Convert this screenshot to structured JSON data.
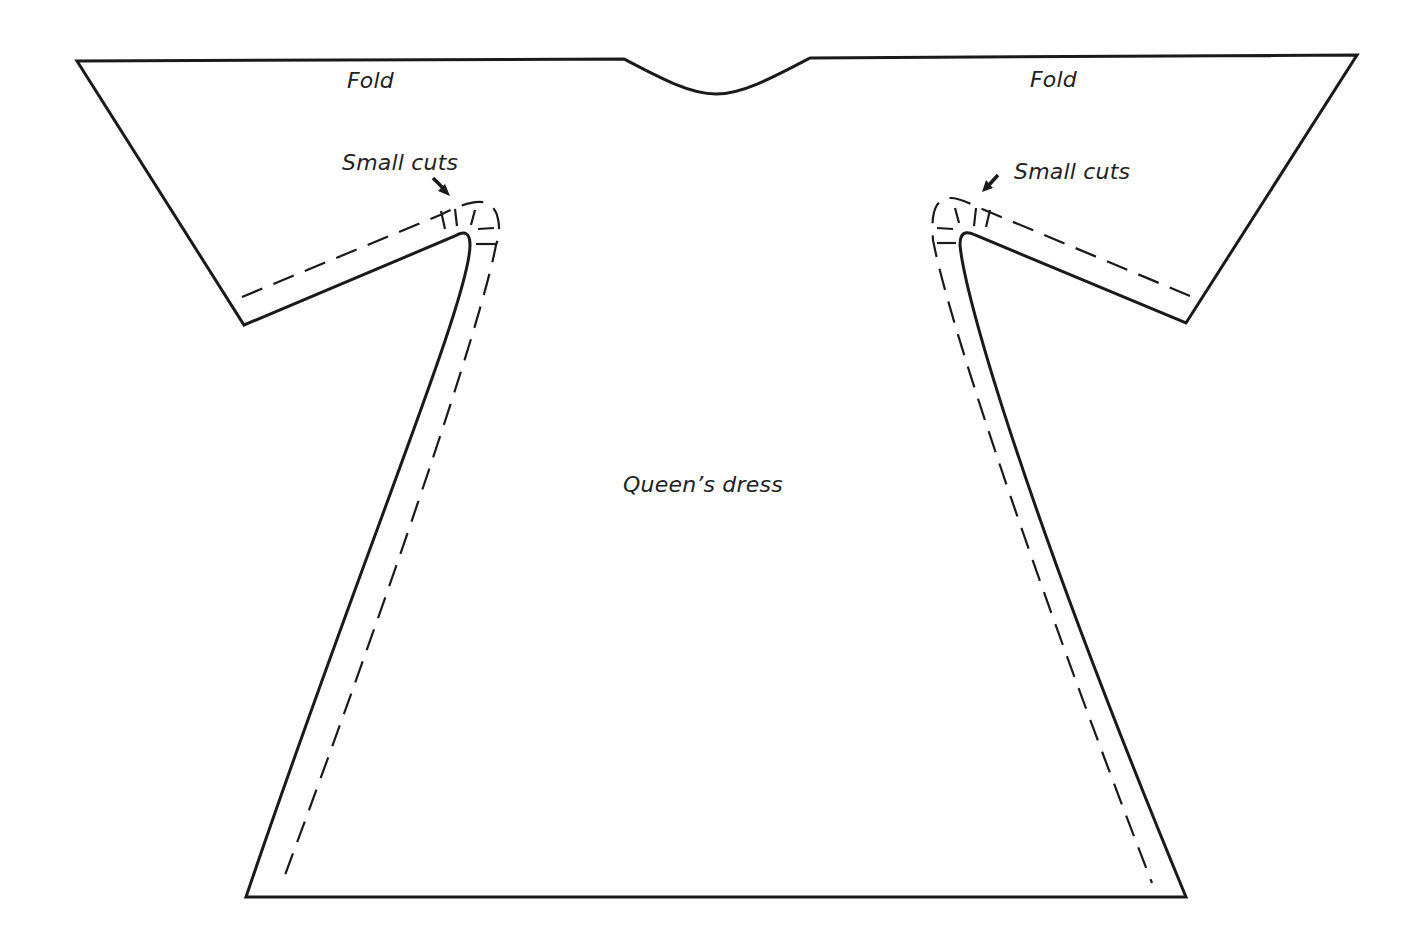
{
  "diagram": {
    "labels": {
      "fold_left": "Fold",
      "fold_right": "Fold",
      "small_cuts_left": "Small cuts",
      "small_cuts_right": "Small cuts",
      "center": "Queen’s dress"
    },
    "style": {
      "line_color": "#1a1a1a",
      "background": "#ffffff"
    },
    "elements": [
      {
        "type": "outline",
        "name": "pattern-outline",
        "style": "solid"
      },
      {
        "type": "seam-allowance",
        "name": "left-seam-line",
        "style": "dashed"
      },
      {
        "type": "seam-allowance",
        "name": "right-seam-line",
        "style": "dashed"
      },
      {
        "type": "neckline",
        "name": "neckline-curve",
        "style": "solid"
      },
      {
        "type": "cuts",
        "name": "left-underarm-cuts",
        "count": 5
      },
      {
        "type": "cuts",
        "name": "right-underarm-cuts",
        "count": 5
      }
    ]
  }
}
